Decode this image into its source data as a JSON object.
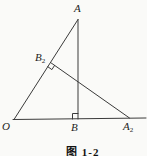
{
  "figure": {
    "caption": "图 1-2",
    "labels": {
      "A": {
        "main": "A"
      },
      "B2": {
        "main": "B",
        "sub": "2"
      },
      "O": {
        "main": "O"
      },
      "B": {
        "main": "B"
      },
      "A2": {
        "main": "A",
        "sub": "2"
      }
    },
    "colors": {
      "background": "#fafaf8",
      "line": "#3a3a3a",
      "label": "#1d1d1d"
    },
    "geometry": {
      "points": {
        "O": [
          14,
          119.5
        ],
        "A": [
          78,
          19.5
        ],
        "B": [
          78,
          119
        ],
        "B2": [
          50.5,
          62.5
        ],
        "A2": [
          129.5,
          118
        ]
      },
      "right_angle_marks": [
        "B",
        "B2"
      ]
    }
  }
}
